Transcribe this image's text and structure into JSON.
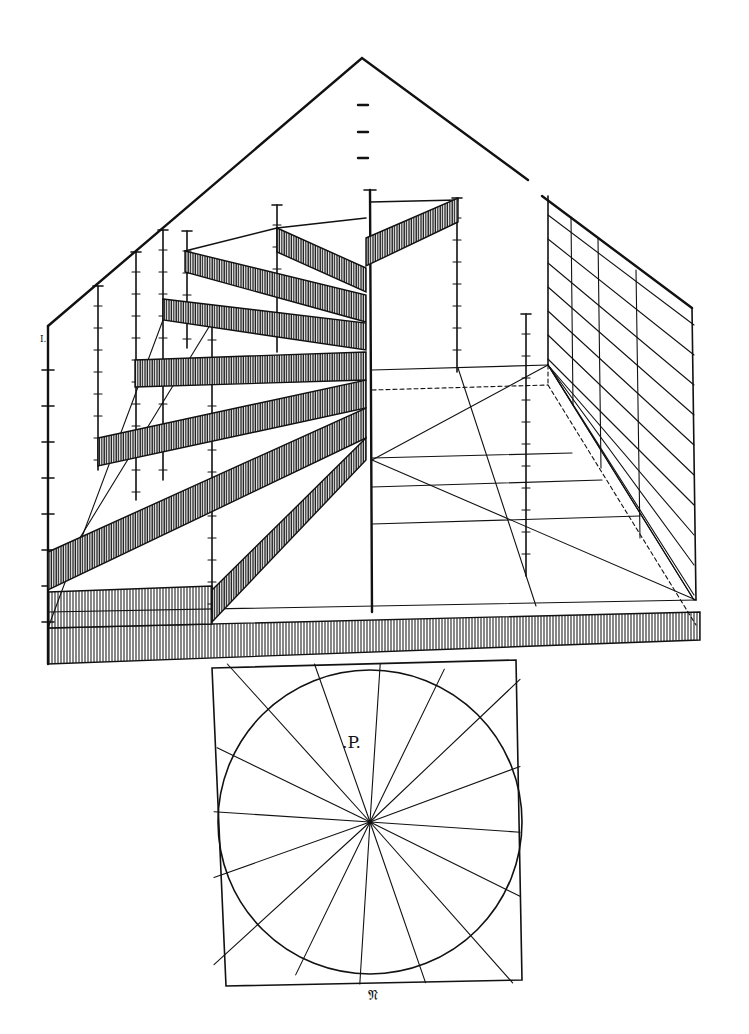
{
  "figure": {
    "colors": {
      "ink": "#111111",
      "paper": "#ffffff"
    }
  },
  "labels": {
    "plan_label": ".P.",
    "signature_mark": "𝔑",
    "corner_mark": "I."
  },
  "elevation": {
    "gable_outline": [
      [
        48,
        326
      ],
      [
        362,
        58
      ],
      [
        528,
        180
      ]
    ],
    "right_wall_top": [
      [
        542,
        196
      ],
      [
        692,
        308
      ]
    ],
    "left_edge": [
      [
        48,
        326
      ],
      [
        48,
        664
      ]
    ],
    "central_newel": [
      [
        370,
        190
      ],
      [
        372,
        612
      ]
    ],
    "floor_back_line": [
      [
        372,
        370
      ],
      [
        548,
        365
      ]
    ],
    "floor_dashed_back": [
      [
        372,
        390
      ],
      [
        548,
        385
      ]
    ],
    "right_wall_vertical": [
      [
        548,
        196
      ],
      [
        548,
        365
      ]
    ],
    "right_wall_far_edge": [
      [
        692,
        308
      ],
      [
        696,
        600
      ]
    ],
    "right_wall_inner_verticals": [
      [
        [
          571,
          217
        ],
        [
          573,
          405
        ]
      ],
      [
        [
          598,
          238
        ],
        [
          601,
          468
        ]
      ],
      [
        [
          636,
          270
        ],
        [
          640,
          538
        ]
      ]
    ],
    "right_wall_diagonals_count": 12,
    "floor_lines": [
      [
        [
          372,
          458
        ],
        [
          572,
          453
        ]
      ],
      [
        [
          372,
          487
        ],
        [
          602,
          480
        ]
      ],
      [
        [
          372,
          524
        ],
        [
          640,
          516
        ]
      ],
      [
        [
          48,
          612
        ],
        [
          696,
          600
        ]
      ]
    ],
    "floor_diagonals": [
      [
        [
          372,
          460
        ],
        [
          548,
          365
        ]
      ],
      [
        [
          372,
          460
        ],
        [
          696,
          600
        ]
      ],
      [
        [
          458,
          368
        ],
        [
          536,
          606
        ]
      ]
    ],
    "posts": [
      {
        "x": 98,
        "top": 286,
        "bottom": 470
      },
      {
        "x": 136,
        "top": 252,
        "bottom": 500
      },
      {
        "x": 163,
        "top": 230,
        "bottom": 480
      },
      {
        "x": 187,
        "top": 231,
        "bottom": 348
      },
      {
        "x": 212,
        "top": 320,
        "bottom": 612
      },
      {
        "x": 277,
        "top": 205,
        "bottom": 352
      },
      {
        "x": 457,
        "top": 198,
        "bottom": 372
      },
      {
        "x": 526,
        "top": 314,
        "bottom": 576
      }
    ],
    "ladder_ticks_center": [
      105,
      132,
      158
    ],
    "stair_treads": [
      {
        "pts": [
          [
            366,
            238
          ],
          [
            458,
            198
          ],
          [
            458,
            222
          ],
          [
            366,
            266
          ]
        ]
      },
      {
        "pts": [
          [
            277,
            228
          ],
          [
            366,
            268
          ],
          [
            366,
            292
          ],
          [
            277,
            252
          ]
        ]
      },
      {
        "pts": [
          [
            185,
            251
          ],
          [
            366,
            295
          ],
          [
            366,
            322
          ],
          [
            185,
            272
          ]
        ]
      },
      {
        "pts": [
          [
            163,
            299
          ],
          [
            366,
            323
          ],
          [
            366,
            350
          ],
          [
            163,
            320
          ]
        ]
      },
      {
        "pts": [
          [
            135,
            360
          ],
          [
            366,
            352
          ],
          [
            366,
            380
          ],
          [
            135,
            387
          ]
        ]
      },
      {
        "pts": [
          [
            98,
            438
          ],
          [
            366,
            380
          ],
          [
            366,
            408
          ],
          [
            98,
            466
          ]
        ]
      },
      {
        "pts": [
          [
            48,
            552
          ],
          [
            366,
            408
          ],
          [
            366,
            438
          ],
          [
            48,
            590
          ]
        ]
      },
      {
        "pts": [
          [
            212,
            590
          ],
          [
            366,
            438
          ],
          [
            366,
            460
          ],
          [
            212,
            622
          ]
        ]
      }
    ],
    "bottom_step": {
      "pts": [
        [
          48,
          592
        ],
        [
          212,
          586
        ],
        [
          212,
          624
        ],
        [
          48,
          628
        ]
      ]
    },
    "base_plinth": {
      "pts": [
        [
          48,
          628
        ],
        [
          700,
          612
        ],
        [
          700,
          640
        ],
        [
          48,
          664
        ]
      ]
    }
  },
  "plan": {
    "square": [
      [
        212,
        668
      ],
      [
        516,
        660
      ],
      [
        522,
        980
      ],
      [
        226,
        986
      ]
    ],
    "center": [
      370,
      822
    ],
    "radius": 152,
    "spokes": 16,
    "label_pos": [
      342,
      748
    ]
  }
}
